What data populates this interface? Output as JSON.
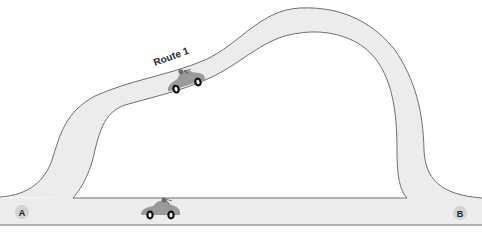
{
  "diagram": {
    "title": "",
    "colors": {
      "background": "#ffffff",
      "road": "#ececec",
      "road_edge": "#6e6e6e",
      "point_marker": "#d3d3d3",
      "car_body": "#9a9a9a"
    },
    "routes": [
      {
        "id": "route-1",
        "label": "Route 1",
        "shape": "curved arch over the straight road"
      },
      {
        "id": "route-straight",
        "label": "",
        "shape": "straight road from A to B"
      }
    ],
    "points": [
      {
        "id": "a",
        "label": "A",
        "position": "left end of straight road"
      },
      {
        "id": "b",
        "label": "B",
        "position": "right end of straight road"
      }
    ],
    "cars": [
      {
        "id": "car-route-1",
        "on_route": "route-1",
        "icon": "car-icon"
      },
      {
        "id": "car-straight",
        "on_route": "route-straight",
        "icon": "car-icon"
      }
    ]
  }
}
